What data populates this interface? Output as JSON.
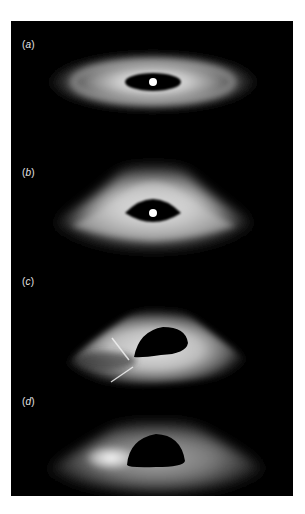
{
  "figure": {
    "background": "#000000",
    "panels": [
      {
        "id": "a",
        "label_open": "(",
        "label_letter": "a",
        "label_close": ")",
        "description": "face-on-ish accretion disk with central white source"
      },
      {
        "id": "b",
        "label_open": "(",
        "label_letter": "b",
        "label_close": ")",
        "description": "warped accretion disk with central white source"
      },
      {
        "id": "c",
        "label_open": "(",
        "label_letter": "c",
        "label_close": ")",
        "description": "lensed disk with black hole shadow and caustic streaks"
      },
      {
        "id": "d",
        "label_open": "(",
        "label_letter": "d",
        "label_close": ")",
        "description": "lensed disk with black hole shadow, bright left side"
      }
    ]
  }
}
